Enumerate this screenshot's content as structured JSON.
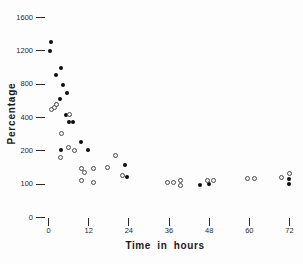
{
  "chart_data": {
    "type": "scatter",
    "title": "",
    "xlabel": "Time in hours",
    "ylabel": "Percentage",
    "x_ticks": [
      0,
      12,
      24,
      36,
      48,
      60,
      72
    ],
    "y_ticks": [
      0,
      100,
      200,
      400,
      800,
      1200,
      1600
    ],
    "axis_style": "ticks only, no axis lines; y tick values evenly spaced (non-linear value scale)",
    "xlim": [
      0,
      72
    ],
    "marker_colors": {
      "filled": "#0d0d0d",
      "open": "#4a4a4a"
    },
    "series": [
      {
        "name": "filled circles",
        "marker": "filled-circle",
        "points": [
          [
            0.6,
            1190
          ],
          [
            1.0,
            1300
          ],
          [
            2.4,
            900
          ],
          [
            3.9,
            990
          ],
          [
            4.5,
            780
          ],
          [
            5.7,
            690
          ],
          [
            3.6,
            620
          ],
          [
            5.4,
            430
          ],
          [
            6.3,
            370
          ],
          [
            7.5,
            370
          ],
          [
            10.0,
            250
          ],
          [
            3.9,
            200
          ],
          [
            12.0,
            200
          ],
          [
            23.0,
            155
          ],
          [
            23.6,
            120
          ],
          [
            45.4,
            95
          ],
          [
            48.0,
            100
          ],
          [
            72.0,
            115
          ],
          [
            72.0,
            100
          ]
        ]
      },
      {
        "name": "open circles",
        "marker": "open-circle",
        "points": [
          [
            0.9,
            490
          ],
          [
            1.8,
            520
          ],
          [
            2.4,
            545
          ],
          [
            6.3,
            430
          ],
          [
            3.9,
            300
          ],
          [
            6.0,
            220
          ],
          [
            7.8,
            200
          ],
          [
            3.6,
            180
          ],
          [
            20.3,
            185
          ],
          [
            17.9,
            150
          ],
          [
            10.1,
            145
          ],
          [
            11.0,
            135
          ],
          [
            13.7,
            145
          ],
          [
            10.1,
            110
          ],
          [
            13.7,
            105
          ],
          [
            22.4,
            125
          ],
          [
            35.8,
            103
          ],
          [
            37.6,
            103
          ],
          [
            39.7,
            110
          ],
          [
            39.7,
            95
          ],
          [
            47.8,
            110
          ],
          [
            49.3,
            110
          ],
          [
            59.7,
            115
          ],
          [
            61.8,
            115
          ],
          [
            69.9,
            120
          ],
          [
            72.0,
            130
          ]
        ]
      }
    ]
  }
}
